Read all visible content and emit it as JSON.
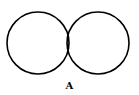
{
  "diagram": {
    "type": "venn",
    "sets": [
      {
        "name": "left-circle",
        "cx": 38,
        "cy": 43,
        "r": 31
      },
      {
        "name": "right-circle",
        "cx": 98,
        "cy": 43,
        "r": 31
      }
    ],
    "shaded_region": "intersection",
    "shading": "diagonal-hatch",
    "caption": "A",
    "stroke_color": "#000000",
    "fill_color": "#ffffff"
  }
}
